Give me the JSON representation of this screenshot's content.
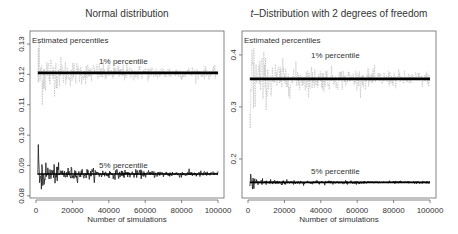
{
  "chart_data": [
    {
      "type": "line",
      "title": "Normal distribution",
      "xlabel": "Number of simulations",
      "ylabel": "",
      "annotation": "Estimated percentiles",
      "xlim": [
        0,
        100000
      ],
      "ylim": [
        0.0793,
        0.1343
      ],
      "xticks": [
        0,
        20000,
        40000,
        60000,
        80000,
        100000
      ],
      "xtick_labels": [
        "0",
        "20000",
        "40000",
        "60000",
        "80000",
        "100000"
      ],
      "yticks": [
        0.08,
        0.09,
        0.1,
        0.11,
        0.12,
        0.13
      ],
      "ytick_labels": [
        "0.08",
        "0.09",
        "0.10",
        "0.11",
        "0.12",
        "0.13"
      ],
      "grid": false,
      "series": [
        {
          "name": "1% percentile",
          "label": "1% percentile",
          "true_value": 0.1205,
          "noise_start": 0.008,
          "color": "#b8b8b8",
          "line_color": "#000000",
          "label_x": 48000,
          "label_y": 0.1235
        },
        {
          "name": "5% percentile",
          "label": "5% percentile",
          "true_value": 0.0872,
          "noise_start": 0.004,
          "color": "#1a1a1a",
          "line_color": "#000000",
          "label_x": 48000,
          "label_y": 0.0893
        }
      ]
    },
    {
      "type": "line",
      "title": "t–Distribution with 2 degrees of freedom",
      "title_italic_prefix": "t",
      "title_rest": "–Distribution with 2 degrees of freedom",
      "xlabel": "Number of simulations",
      "ylabel": "",
      "annotation": "Estimated percentiles",
      "xlim": [
        0,
        100000
      ],
      "ylim": [
        0.125,
        0.446
      ],
      "xticks": [
        0,
        20000,
        40000,
        60000,
        80000,
        100000
      ],
      "xtick_labels": [
        "0",
        "20000",
        "40000",
        "60000",
        "80000",
        "100000"
      ],
      "yticks": [
        0.2,
        0.3,
        0.4
      ],
      "ytick_labels": [
        "0.2",
        "0.3",
        "0.4"
      ],
      "grid": false,
      "series": [
        {
          "name": "1% percentile",
          "label": "1% percentile",
          "true_value": 0.354,
          "noise_start": 0.06,
          "color": "#b8b8b8",
          "line_color": "#000000",
          "label_x": 48000,
          "label_y": 0.395
        },
        {
          "name": "5% percentile",
          "label": "5% percentile",
          "true_value": 0.155,
          "noise_start": 0.01,
          "color": "#1a1a1a",
          "line_color": "#000000",
          "label_x": 48000,
          "label_y": 0.172
        }
      ]
    }
  ],
  "panels": [
    {
      "title": "Normal distribution",
      "annotation": "Estimated percentiles",
      "xlabel": "Number of simulations"
    },
    {
      "title_italic": "t",
      "title_rest": "–Distribution with 2 degrees of freedom",
      "annotation": "Estimated percentiles",
      "xlabel": "Number of simulations"
    }
  ]
}
